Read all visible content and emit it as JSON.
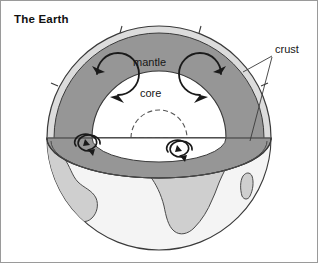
{
  "figure": {
    "title": "The Earth",
    "type": "cutaway-cross-section-diagram"
  },
  "labels": {
    "mantle": "mantle",
    "core": "core",
    "crust": "crust"
  },
  "colors": {
    "mantle_fill": "#969696",
    "crust_fill": "#d9d9d9",
    "core_fill": "#ffffff",
    "ocean_fill": "#f2f2f2",
    "continent_fill": "#cfcfcf",
    "outline": "#3a3a3a",
    "frame": "#9a9a9a",
    "text": "#161616",
    "background": "#ffffff"
  },
  "annotations": {
    "convection_arrows_mantle": 2,
    "convection_arrows_cut_plane": 4,
    "crust_leader_lines": 2,
    "inner_core_dashed": true,
    "plate_breaks_in_crust": 4
  },
  "icons": {
    "convection_arrow": "circular-arrow-icon",
    "leader_line": "leader-line-icon"
  }
}
